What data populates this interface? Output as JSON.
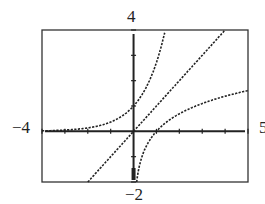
{
  "chart_data": {
    "type": "line",
    "title": "",
    "xlabel": "",
    "ylabel": "",
    "xlim": [
      -4,
      5
    ],
    "ylim": [
      -2,
      4
    ],
    "x_tick_step": 1,
    "y_tick_step": 1,
    "grid": false,
    "window_labels": {
      "xmin": "-4",
      "xmax": "5",
      "ymin": "-2",
      "ymax": "4"
    },
    "series": [
      {
        "name": "y = e^x",
        "x": [
          -4,
          -3,
          -2,
          -1,
          0,
          0.5,
          1,
          1.2,
          1.39
        ],
        "values": [
          0.018,
          0.05,
          0.135,
          0.368,
          1,
          1.649,
          2.718,
          3.32,
          4.0
        ],
        "style": "dotted"
      },
      {
        "name": "y = x",
        "x": [
          -2,
          -1,
          0,
          1,
          2,
          3,
          4
        ],
        "values": [
          -2,
          -1,
          0,
          1,
          2,
          3,
          4
        ],
        "style": "dotted"
      },
      {
        "name": "y = ln x",
        "x": [
          0.135,
          0.25,
          0.5,
          1,
          2,
          3,
          4,
          5
        ],
        "values": [
          -2,
          -1.386,
          -0.693,
          0,
          0.693,
          1.099,
          1.386,
          1.609
        ],
        "style": "dotted"
      }
    ]
  },
  "labels": {
    "top": "4",
    "bottom": "−2",
    "left": "−4",
    "right": "5"
  }
}
